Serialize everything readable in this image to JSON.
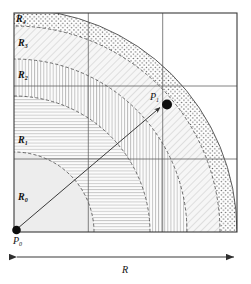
{
  "figure": {
    "type": "geometric-diagram",
    "regions": [
      {
        "id": "R0",
        "label": "R",
        "sub": "0",
        "fill": "light-gray-solid",
        "order": 0
      },
      {
        "id": "R1",
        "label": "R",
        "sub": "1",
        "fill": "horizontal-lines",
        "order": 1
      },
      {
        "id": "R2",
        "label": "R",
        "sub": "2",
        "fill": "vertical-lines",
        "order": 2
      },
      {
        "id": "R3",
        "label": "R",
        "sub": "3",
        "fill": "diagonal-hatch",
        "order": 3
      },
      {
        "id": "R4",
        "label": "R",
        "sub": "4",
        "fill": "dotted-stipple",
        "order": 4
      }
    ],
    "points": [
      {
        "id": "P0",
        "label": "P",
        "sub": "0",
        "role": "origin-corner"
      },
      {
        "id": "P1",
        "label": "P",
        "sub": "1",
        "role": "target-point"
      }
    ],
    "vector": {
      "from": "P0",
      "to": "P1",
      "style": "arrow"
    },
    "dimension": {
      "label": "R",
      "style": "double-headed-arrow",
      "position": "below-box"
    },
    "grid": {
      "vertical_divisions": 3,
      "horizontal_divisions": 3,
      "visible": true
    },
    "colors": {
      "stroke": "#3a3a3a",
      "arc_stroke": "#4a4a4a",
      "fill_light": "#f0f0f0",
      "fill_mid": "#e8e8e8",
      "point": "#0d0d0d",
      "background": "#ffffff"
    }
  }
}
